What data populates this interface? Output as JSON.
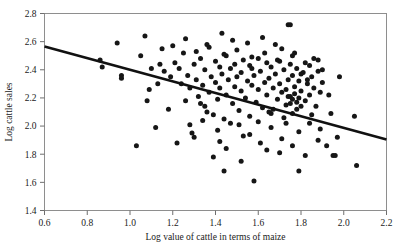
{
  "chart_data": {
    "type": "scatter",
    "title": "",
    "xlabel": "Log value of cattle in terms of maize",
    "ylabel": "Log cattle sales",
    "xlim": [
      0.6,
      2.2
    ],
    "ylim": [
      1.4,
      2.8
    ],
    "xticks": [
      "0.6",
      "0.8",
      "1.0",
      "1.2",
      "1.4",
      "1.6",
      "1.8",
      "2.0",
      "2.2"
    ],
    "xtick_values": [
      0.6,
      0.8,
      1.0,
      1.2,
      1.4,
      1.6,
      1.8,
      2.0,
      2.2
    ],
    "yticks": [
      "1.4",
      "1.6",
      "1.8",
      "2.0",
      "2.2",
      "2.4",
      "2.6",
      "2.8"
    ],
    "ytick_values": [
      1.4,
      1.6,
      1.8,
      2.0,
      2.2,
      2.4,
      2.6,
      2.8
    ],
    "grid": false,
    "legend": false,
    "marker": "filled-circle",
    "marker_color": "#161616",
    "marker_size": 2.5,
    "fit_line": {
      "name": "linear regression fit",
      "color": "#111111",
      "width": 2.6,
      "x_start": 0.6,
      "y_start": 2.565,
      "x_end": 2.2,
      "y_end": 1.905,
      "slope": -0.4125,
      "intercept": 2.8125
    },
    "points": [
      [
        0.86,
        2.47
      ],
      [
        0.87,
        2.42
      ],
      [
        0.94,
        2.59
      ],
      [
        0.96,
        2.36
      ],
      [
        0.96,
        2.34
      ],
      [
        1.03,
        1.86
      ],
      [
        1.05,
        2.5
      ],
      [
        1.07,
        2.64
      ],
      [
        1.09,
        2.26
      ],
      [
        1.12,
        1.99
      ],
      [
        1.14,
        2.44
      ],
      [
        1.15,
        2.55
      ],
      [
        1.16,
        2.39
      ],
      [
        1.18,
        2.12
      ],
      [
        1.19,
        2.35
      ],
      [
        1.21,
        2.45
      ],
      [
        1.22,
        1.88
      ],
      [
        1.23,
        2.41
      ],
      [
        1.24,
        2.3
      ],
      [
        1.25,
        2.52
      ],
      [
        1.26,
        2.18
      ],
      [
        1.27,
        2.36
      ],
      [
        1.28,
        2.27
      ],
      [
        1.29,
        1.95
      ],
      [
        1.3,
        2.44
      ],
      [
        1.31,
        2.33
      ],
      [
        1.32,
        2.21
      ],
      [
        1.33,
        2.48
      ],
      [
        1.34,
        2.29
      ],
      [
        1.35,
        2.4
      ],
      [
        1.35,
        2.14
      ],
      [
        1.36,
        2.58
      ],
      [
        1.37,
        2.24
      ],
      [
        1.38,
        2.35
      ],
      [
        1.39,
        2.08
      ],
      [
        1.4,
        2.46
      ],
      [
        1.4,
        2.31
      ],
      [
        1.41,
        2.19
      ],
      [
        1.42,
        2.42
      ],
      [
        1.42,
        2.27
      ],
      [
        1.43,
        2.37
      ],
      [
        1.44,
        2.05
      ],
      [
        1.45,
        2.5
      ],
      [
        1.45,
        2.22
      ],
      [
        1.46,
        2.33
      ],
      [
        1.47,
        2.41
      ],
      [
        1.48,
        2.16
      ],
      [
        1.49,
        2.28
      ],
      [
        1.49,
        2.44
      ],
      [
        1.5,
        2.35
      ],
      [
        1.51,
        2.11
      ],
      [
        1.52,
        2.38
      ],
      [
        1.52,
        2.25
      ],
      [
        1.53,
        2.47
      ],
      [
        1.54,
        2.2
      ],
      [
        1.55,
        2.32
      ],
      [
        1.56,
        2.43
      ],
      [
        1.56,
        2.07
      ],
      [
        1.57,
        2.29
      ],
      [
        1.58,
        2.36
      ],
      [
        1.59,
        2.17
      ],
      [
        1.6,
        2.48
      ],
      [
        1.6,
        2.26
      ],
      [
        1.61,
        2.39
      ],
      [
        1.62,
        2.13
      ],
      [
        1.63,
        2.31
      ],
      [
        1.64,
        2.45
      ],
      [
        1.64,
        2.22
      ],
      [
        1.65,
        2.34
      ],
      [
        1.66,
        2.42
      ],
      [
        1.66,
        2.09
      ],
      [
        1.67,
        2.27
      ],
      [
        1.68,
        2.37
      ],
      [
        1.69,
        2.19
      ],
      [
        1.7,
        2.46
      ],
      [
        1.7,
        2.3
      ],
      [
        1.71,
        2.24
      ],
      [
        1.72,
        2.4
      ],
      [
        1.73,
        2.15
      ],
      [
        1.74,
        2.33
      ],
      [
        1.75,
        2.44
      ],
      [
        1.75,
        2.21
      ],
      [
        1.76,
        2.36
      ],
      [
        1.77,
        2.28
      ],
      [
        1.78,
        2.41
      ],
      [
        1.78,
        2.12
      ],
      [
        1.79,
        2.32
      ],
      [
        1.8,
        2.25
      ],
      [
        1.81,
        2.38
      ],
      [
        1.82,
        2.18
      ],
      [
        1.83,
        2.3
      ],
      [
        1.84,
        2.43
      ],
      [
        1.84,
        2.22
      ],
      [
        1.85,
        2.35
      ],
      [
        1.86,
        2.27
      ],
      [
        1.87,
        2.14
      ],
      [
        1.88,
        2.39
      ],
      [
        1.89,
        2.24
      ],
      [
        1.9,
        2.31
      ],
      [
        1.28,
        2.01
      ],
      [
        1.31,
        2.53
      ],
      [
        1.34,
        2.04
      ],
      [
        1.37,
        2.56
      ],
      [
        1.41,
        1.97
      ],
      [
        1.44,
        2.51
      ],
      [
        1.47,
        2.02
      ],
      [
        1.5,
        2.54
      ],
      [
        1.53,
        1.93
      ],
      [
        1.57,
        2.49
      ],
      [
        1.6,
        2.03
      ],
      [
        1.63,
        2.52
      ],
      [
        1.66,
        1.99
      ],
      [
        1.69,
        2.47
      ],
      [
        1.72,
        2.06
      ],
      [
        1.76,
        2.5
      ],
      [
        1.79,
        1.96
      ],
      [
        1.82,
        2.45
      ],
      [
        1.85,
        2.08
      ],
      [
        1.88,
        2.47
      ],
      [
        1.39,
        1.78
      ],
      [
        1.45,
        1.84
      ],
      [
        1.52,
        1.75
      ],
      [
        1.58,
        1.61
      ],
      [
        1.64,
        1.83
      ],
      [
        1.7,
        1.81
      ],
      [
        1.76,
        1.86
      ],
      [
        1.82,
        1.79
      ],
      [
        1.88,
        1.9
      ],
      [
        1.94,
        2.09
      ],
      [
        1.95,
        1.79
      ],
      [
        1.96,
        1.79
      ],
      [
        2.05,
        2.07
      ],
      [
        2.06,
        1.72
      ],
      [
        1.93,
        2.22
      ],
      [
        1.98,
        2.35
      ],
      [
        1.74,
        2.72
      ],
      [
        1.75,
        2.72
      ],
      [
        1.77,
        2.52
      ],
      [
        1.8,
        2.37
      ],
      [
        1.83,
        2.33
      ],
      [
        1.62,
        2.63
      ],
      [
        1.68,
        2.58
      ],
      [
        1.71,
        2.55
      ],
      [
        1.86,
        2.48
      ],
      [
        1.9,
        2.4
      ],
      [
        1.26,
        2.62
      ],
      [
        1.2,
        2.57
      ],
      [
        1.13,
        2.3
      ],
      [
        1.1,
        2.41
      ],
      [
        1.08,
        2.18
      ],
      [
        1.43,
        2.66
      ],
      [
        1.48,
        2.61
      ],
      [
        1.55,
        2.59
      ],
      [
        1.67,
        2.12
      ],
      [
        1.73,
        2.02
      ],
      [
        1.3,
        1.92
      ],
      [
        1.36,
        2.1
      ],
      [
        1.33,
        2.16
      ],
      [
        1.42,
        1.89
      ],
      [
        1.51,
        2.01
      ],
      [
        1.56,
        1.94
      ],
      [
        1.61,
        1.88
      ],
      [
        1.65,
        2.1
      ],
      [
        1.71,
        1.91
      ],
      [
        1.79,
        1.68
      ],
      [
        1.84,
        2.02
      ],
      [
        1.89,
        1.98
      ],
      [
        1.92,
        1.86
      ],
      [
        1.97,
        1.92
      ],
      [
        1.44,
        1.68
      ],
      [
        1.57,
        2.41
      ],
      [
        1.73,
        2.26
      ],
      [
        1.76,
        2.19
      ],
      [
        1.77,
        2.23
      ],
      [
        1.78,
        2.17
      ],
      [
        1.75,
        2.16
      ],
      [
        1.74,
        2.21
      ],
      [
        1.79,
        2.2
      ],
      [
        1.8,
        2.14
      ],
      [
        1.76,
        2.09
      ]
    ]
  }
}
